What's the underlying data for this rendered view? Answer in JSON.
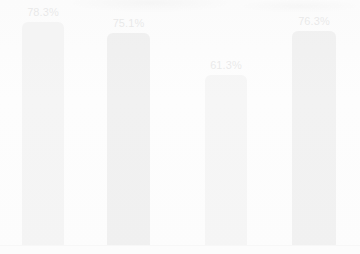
{
  "chart_data": {
    "type": "bar",
    "title": "",
    "subtitle": "",
    "xlabel": "",
    "ylabel": "",
    "ylim": [
      0,
      100
    ],
    "grid": false,
    "legend": false,
    "legend_position": "none",
    "categories": [
      "",
      "",
      "",
      ""
    ],
    "values": [
      78.3,
      75.1,
      61.3,
      76.3
    ],
    "data_labels": [
      "78.3%",
      "75.1%",
      "61.3%",
      "76.3%"
    ],
    "annotations": [],
    "tick_labels": {
      "x": [],
      "y": []
    },
    "bar_colors": [
      "#b4b4b4",
      "#8a8a8a",
      "#b6b6b6",
      "#8d8d8d"
    ],
    "baseline_color": "#c9c9c9",
    "label_color": "#3b3b3b",
    "background_color": "#fdfdfd"
  },
  "bars": [
    {
      "label": "78.3%",
      "value": 78.3,
      "color": "#b4b4b4",
      "left": 22,
      "width": 42,
      "height": 223,
      "label_left": 16,
      "label_top": 6,
      "label_width": 54
    },
    {
      "label": "75.1%",
      "value": 75.1,
      "color": "#8a8a8a",
      "left": 107,
      "width": 43,
      "height": 212,
      "label_left": 101,
      "label_top": 17,
      "label_width": 55
    },
    {
      "label": "61.3%",
      "value": 61.3,
      "color": "#b6b6b6",
      "left": 205,
      "width": 42,
      "height": 170,
      "label_left": 199,
      "label_top": 59,
      "label_width": 54
    },
    {
      "label": "76.3%",
      "value": 76.3,
      "color": "#8d8d8d",
      "left": 292,
      "width": 44,
      "height": 214,
      "label_left": 287,
      "label_top": 15,
      "label_width": 54
    }
  ]
}
